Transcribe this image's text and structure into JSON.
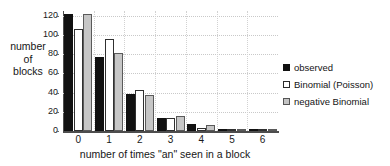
{
  "chart_data": {
    "type": "bar",
    "title": "",
    "xlabel": "number of times \"an\" seen in a block",
    "ylabel": "number of blocks",
    "ylabel_lines": [
      "number",
      "of",
      "blocks"
    ],
    "categories": [
      "0",
      "1",
      "2",
      "3",
      "4",
      "5",
      "6"
    ],
    "ylim": [
      0,
      125
    ],
    "yticks": [
      0,
      20,
      40,
      60,
      80,
      100,
      120
    ],
    "grid": true,
    "grid_style": "dotted-horizontal-and-vertical",
    "legend_position": "right",
    "series": [
      {
        "name": "observed",
        "color": "#111111",
        "fill": "solid-black",
        "values": [
          122,
          77,
          39,
          14,
          7,
          1,
          1
        ]
      },
      {
        "name": "Binomial (Poisson)",
        "color": "#ffffff",
        "fill": "open-white",
        "values": [
          106,
          96,
          43,
          14,
          3,
          2,
          1
        ]
      },
      {
        "name": "negative Binomial",
        "color": "#c6c6c6",
        "fill": "gray",
        "values": [
          122,
          81,
          37,
          16,
          6,
          1,
          1
        ]
      }
    ]
  },
  "legend": {
    "items": [
      {
        "label": "observed"
      },
      {
        "label": "Binomial (Poisson)"
      },
      {
        "label": "negative Binomial"
      }
    ]
  }
}
